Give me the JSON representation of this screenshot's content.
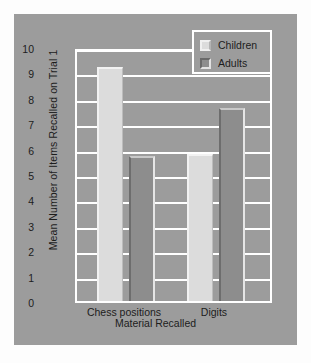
{
  "chart_data": {
    "type": "bar",
    "title": "",
    "xlabel": "Material Recalled",
    "ylabel": "Mean Number of Items Recalled on Trial 1",
    "categories": [
      "Chess positions",
      "Digits"
    ],
    "series": [
      {
        "name": "Children",
        "values": [
          9.2,
          5.8
        ],
        "color": "#dcdcdc"
      },
      {
        "name": "Adults",
        "values": [
          5.7,
          7.6
        ],
        "color": "#8d8d8d"
      }
    ],
    "ylim": [
      0,
      10
    ],
    "yticks": [
      10,
      9,
      8,
      7,
      6,
      5,
      4,
      3,
      2,
      1,
      0
    ],
    "ytick_labels": [
      "10",
      "9",
      "8",
      "7",
      "6",
      "5",
      "4",
      "3",
      "2",
      "1",
      "0"
    ],
    "grid": true,
    "grid_color": "#ffffff",
    "legend_position": "top-right",
    "legend_entries": [
      "Children",
      "Adults"
    ],
    "plot_background": "#9c9c9c",
    "figure_background": "#9c9c9c",
    "page_background": "#fdfdfd"
  }
}
